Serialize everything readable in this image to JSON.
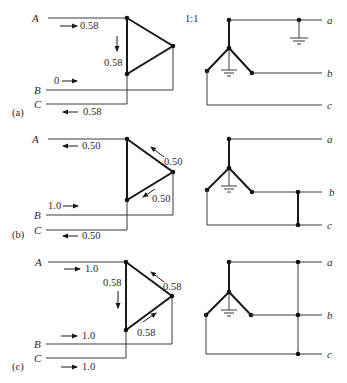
{
  "figure": {
    "ratio_label": "1:1",
    "panels": [
      {
        "id": "a",
        "panel_label": "(a)",
        "primary_labels": {
          "A": "A",
          "B": "B",
          "C": "C"
        },
        "secondary_labels": {
          "a": "a",
          "b": "b",
          "c": "c"
        },
        "currents": {
          "line_A": "0.58",
          "line_B": "0",
          "line_C": "0.58",
          "delta_side": "0.58"
        },
        "y": {
          "A": 18,
          "B": 90,
          "C": 104,
          "tri_top": 18,
          "tri_right": 46,
          "tri_bot": 74,
          "sec_a": 20,
          "star_c": 48,
          "star_l": 71,
          "star_r": 73,
          "sec_c": 105
        },
        "secondary_fault": "single-line-to-ground on phase a"
      },
      {
        "id": "b",
        "panel_label": "(b)",
        "primary_labels": {
          "A": "A",
          "B": "B",
          "C": "C"
        },
        "secondary_labels": {
          "a": "a",
          "b": "b",
          "c": "c"
        },
        "currents": {
          "line_A": "0.50",
          "line_B": "1.0",
          "line_C": "0.50",
          "delta_upper": "0.50",
          "delta_lower": "0.50"
        },
        "secondary_fault": "line-to-line between phases b and c"
      },
      {
        "id": "c",
        "panel_label": "(c)",
        "primary_labels": {
          "A": "A",
          "B": "B",
          "C": "C"
        },
        "secondary_labels": {
          "a": "a",
          "b": "b",
          "c": "c"
        },
        "currents": {
          "line_A": "1.0",
          "line_B": "1.0",
          "line_C": "1.0",
          "delta_side": "0.58",
          "delta_upper": "0.58",
          "delta_lower": "0.58"
        },
        "secondary_fault": "three-phase fault a-b-c"
      }
    ]
  }
}
